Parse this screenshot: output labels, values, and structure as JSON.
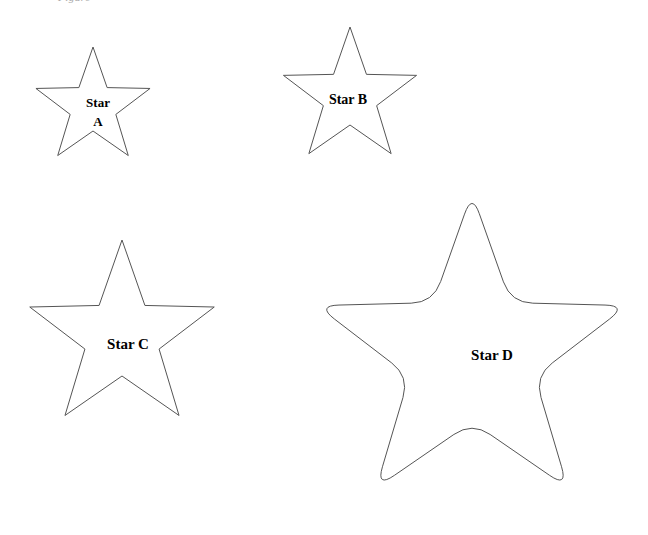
{
  "page": {
    "background_color": "#ffffff",
    "stroke_color": "#555555",
    "label_color": "#000000",
    "width": 648,
    "height": 535
  },
  "clipped_header": {
    "text": "Figure"
  },
  "figure": {
    "type": "line-drawing",
    "shape_kind": "five-pointed-star",
    "count": 4,
    "stars": [
      {
        "id": "star-a",
        "label_line1": "Star",
        "label_line2": "A",
        "label_full": "Star A",
        "points": 5,
        "point_style": "sharp",
        "center_x": 93,
        "center_y": 107,
        "outer_radius": 60,
        "inner_radius": 24,
        "rotation_deg": -90,
        "bbox": [
          33,
          48,
          152,
          165
        ],
        "label_x": 98,
        "label_y1": 107,
        "label_y2": 126,
        "label_font_size": 13
      },
      {
        "id": "star-b",
        "label_line1": "Star B",
        "label_line2": "",
        "label_full": "Star B",
        "points": 5,
        "point_style": "sharp",
        "center_x": 350,
        "center_y": 97,
        "outer_radius": 70,
        "inner_radius": 28,
        "rotation_deg": -90,
        "bbox": [
          283,
          28,
          418,
          165
        ],
        "label_x": 348,
        "label_y1": 104,
        "label_y2": 0,
        "label_font_size": 14
      },
      {
        "id": "star-c",
        "label_line1": "Star C",
        "label_line2": "",
        "label_full": "Star C",
        "points": 5,
        "point_style": "sharp",
        "center_x": 122,
        "center_y": 337,
        "outer_radius": 97,
        "inner_radius": 39,
        "rotation_deg": -90,
        "bbox": [
          20,
          241,
          228,
          430
        ],
        "label_x": 128,
        "label_y1": 349,
        "label_y2": 0,
        "label_font_size": 15
      },
      {
        "id": "star-d",
        "label_line1": "Star D",
        "label_line2": "",
        "label_full": "Star D",
        "points": 5,
        "point_style": "rounded",
        "center_x": 472,
        "center_y": 356,
        "outer_radius": 163,
        "inner_radius": 66,
        "corner_radius": 22,
        "rotation_deg": -90,
        "bbox": [
          317,
          194,
          630,
          516
        ],
        "label_x": 492,
        "label_y1": 360,
        "label_y2": 0,
        "label_font_size": 15
      }
    ]
  }
}
